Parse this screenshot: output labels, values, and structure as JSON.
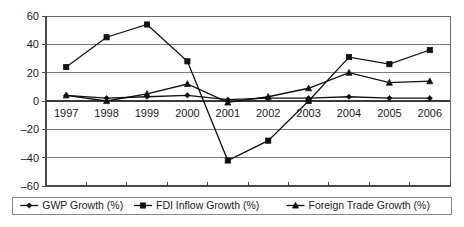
{
  "chart_data": {
    "type": "line",
    "title": "",
    "xlabel": "",
    "ylabel": "",
    "categories": [
      "1997",
      "1998",
      "1999",
      "2000",
      "2001",
      "2002",
      "2003",
      "2004",
      "2005",
      "2006"
    ],
    "ylim": [
      -60,
      60
    ],
    "yticks": [
      60,
      40,
      20,
      0,
      -20,
      -40,
      -60
    ],
    "ytick_labels": [
      "60",
      "40",
      "20",
      "0",
      "–20",
      "–40",
      "–60"
    ],
    "grid": true,
    "legend_position": "bottom",
    "series": [
      {
        "name": "GWP Growth (%)",
        "marker": "diamond",
        "color": "#111111",
        "values": [
          4,
          2,
          3,
          4,
          1,
          2,
          2,
          3,
          2,
          2
        ]
      },
      {
        "name": "FDI Inflow Growth (%)",
        "marker": "square",
        "color": "#111111",
        "values": [
          24,
          45,
          54,
          28,
          -42,
          -28,
          0,
          31,
          26,
          36
        ]
      },
      {
        "name": "Foreign Trade Growth (%)",
        "marker": "triangle",
        "color": "#111111",
        "values": [
          4,
          0,
          5,
          12,
          -1,
          3,
          9,
          20,
          13,
          14
        ]
      }
    ]
  },
  "legend": {
    "items": [
      {
        "label": "GWP Growth (%)",
        "marker": "diamond"
      },
      {
        "label": "FDI Inflow Growth (%)",
        "marker": "square"
      },
      {
        "label": "Foreign Trade Growth (%)",
        "marker": "triangle"
      }
    ]
  }
}
